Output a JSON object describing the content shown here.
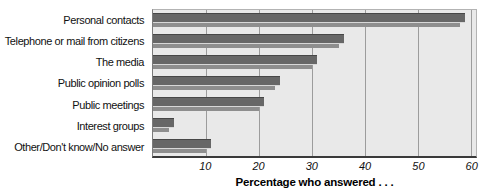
{
  "chart_data": {
    "type": "bar",
    "orientation": "horizontal",
    "title": "",
    "categories": [
      "Personal contacts",
      "Telephone or mail from citizens",
      "The media",
      "Public opinion polls",
      "Public meetings",
      "Interest groups",
      "Other/Don't know/No answer"
    ],
    "values": [
      59,
      36,
      31,
      24,
      21,
      4,
      11
    ],
    "xlabel": "Percentage who answered . . .",
    "ylabel": "",
    "xticks": [
      10,
      20,
      30,
      40,
      50,
      60
    ],
    "xlim": [
      0,
      61
    ],
    "grid": true,
    "legend": false,
    "colors": {
      "bar": "#676767",
      "bar_shadow": "#8e8e8e",
      "plot_background": "#e9e9e9",
      "gridline": "#9c9c9c",
      "axis_bottom": "#3a3a3a"
    }
  }
}
